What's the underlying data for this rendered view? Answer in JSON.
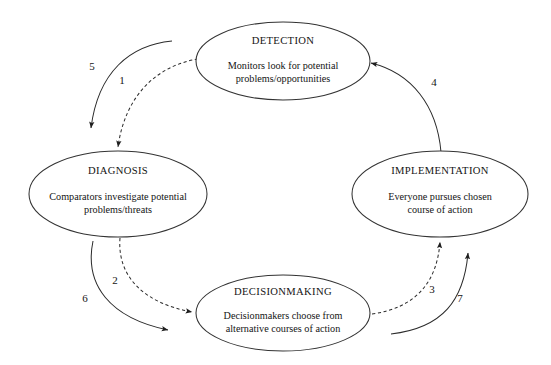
{
  "diagram": {
    "kind": "organizational-decision-cycle",
    "nodes": [
      {
        "id": "detection",
        "title": "DETECTION",
        "body_line1": "Monitors look for potential",
        "body_line2": "problems/opportunities",
        "cx": 283,
        "cy": 61,
        "rx": 87,
        "ry": 39
      },
      {
        "id": "diagnosis",
        "title": "DIAGNOSIS",
        "body_line1": "Comparators investigate potential",
        "body_line2": "problems/threats",
        "cx": 118,
        "cy": 194,
        "rx": 89,
        "ry": 43
      },
      {
        "id": "decisionmaking",
        "title": "DECISIONMAKING",
        "body_line1": "Decisionmakers choose from",
        "body_line2": "alternative courses of action",
        "cx": 283,
        "cy": 313,
        "rx": 87,
        "ry": 38
      },
      {
        "id": "implementation",
        "title": "IMPLEMENTATION",
        "body_line1": "Everyone pursues chosen",
        "body_line2": "course of action",
        "cx": 440,
        "cy": 194,
        "rx": 88,
        "ry": 43
      }
    ],
    "arcs": [
      {
        "id": "arc-1",
        "label": "1",
        "style": "dashed",
        "from": "detection",
        "to": "diagnosis",
        "label_x": 122,
        "label_y": 84
      },
      {
        "id": "arc-2",
        "label": "2",
        "style": "dashed",
        "from": "diagnosis",
        "to": "decisionmaking",
        "label_x": 115,
        "label_y": 284
      },
      {
        "id": "arc-3",
        "label": "3",
        "style": "dashed",
        "from": "decisionmaking",
        "to": "implementation",
        "label_x": 432,
        "label_y": 293
      },
      {
        "id": "arc-4",
        "label": "4",
        "style": "solid",
        "from": "implementation",
        "to": "detection",
        "label_x": 434,
        "label_y": 86
      },
      {
        "id": "arc-5",
        "label": "5",
        "style": "solid",
        "from": "detection",
        "to": "diagnosis",
        "label_x": 92,
        "label_y": 70
      },
      {
        "id": "arc-6",
        "label": "6",
        "style": "solid",
        "from": "diagnosis",
        "to": "decisionmaking",
        "label_x": 85,
        "label_y": 302
      },
      {
        "id": "arc-7",
        "label": "7",
        "style": "solid",
        "from": "decisionmaking",
        "to": "implementation",
        "label_x": 460,
        "label_y": 302
      }
    ]
  }
}
